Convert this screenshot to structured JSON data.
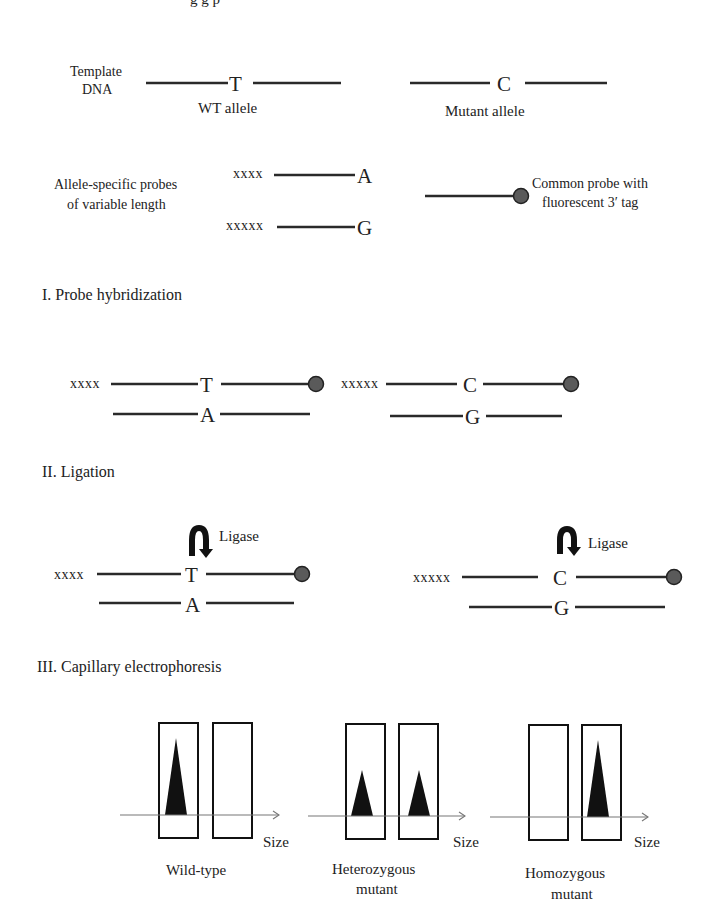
{
  "title_cropped": "g   g   p",
  "top": {
    "template_label_line1": "Template",
    "template_label_line2": "DNA",
    "wt_base": "T",
    "wt_label": "WT allele",
    "mut_base": "C",
    "mut_label": "Mutant allele",
    "probes_label_line1": "Allele-specific probes",
    "probes_label_line2": "of variable length",
    "probe_a_tail": "xxxx",
    "probe_a_base": "A",
    "probe_g_tail": "xxxxx",
    "probe_g_base": "G",
    "common_label_line1": "Common probe with",
    "common_label_line2": "fluorescent 3′ tag"
  },
  "step1": {
    "title": "I. Probe hybridization",
    "left": {
      "tail": "xxxx",
      "top_base": "T",
      "bottom_base": "A"
    },
    "right": {
      "tail": "xxxxx",
      "top_base": "C",
      "bottom_base": "G"
    }
  },
  "step2": {
    "title": "II. Ligation",
    "enzyme_label": "Ligase",
    "left": {
      "tail": "xxxx",
      "top_base": "T",
      "bottom_base": "A",
      "enzyme": "Ligase"
    },
    "right": {
      "tail": "xxxxx",
      "top_base": "C",
      "bottom_base": "G",
      "enzyme": "Ligase"
    }
  },
  "step3": {
    "title": "III. Capillary electrophoresis",
    "axis_label": "Size",
    "panels": [
      {
        "label_line1": "Wild-type",
        "label_line2": "",
        "peak_short_probe": "high",
        "peak_long_probe": "none"
      },
      {
        "label_line1": "Heterozygous",
        "label_line2": "mutant",
        "peak_short_probe": "medium",
        "peak_long_probe": "medium"
      },
      {
        "label_line1": "Homozygous",
        "label_line2": "mutant",
        "peak_short_probe": "none",
        "peak_long_probe": "high"
      }
    ]
  },
  "colors": {
    "line": "#2a2a2a",
    "fluorescent_tag": "#5a5a5a",
    "peak": "#111111",
    "axis": "#777777"
  }
}
